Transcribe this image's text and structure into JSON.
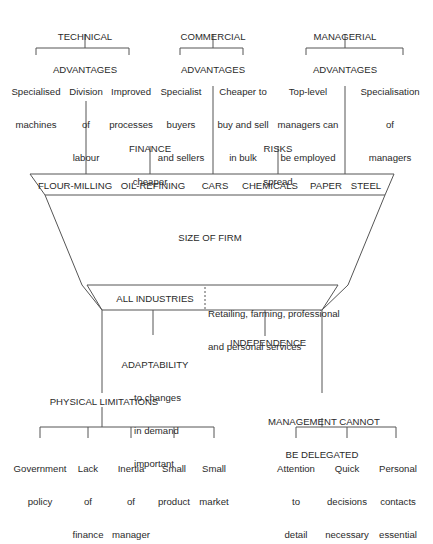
{
  "top_groups": [
    {
      "title": [
        "TECHNICAL",
        "ADVANTAGES"
      ],
      "items": [
        [
          "Specialised",
          "machines"
        ],
        [
          "Division",
          "of",
          "labour"
        ],
        [
          "Improved",
          "processes"
        ]
      ]
    },
    {
      "title": [
        "COMMERCIAL",
        "ADVANTAGES"
      ],
      "items": [
        [
          "Specialist",
          "buyers",
          "and sellers"
        ],
        [
          "Cheaper to",
          "buy and sell",
          "in bulk"
        ]
      ]
    },
    {
      "title": [
        "MANAGERIAL",
        "ADVANTAGES"
      ],
      "items": [
        [
          "Top-level",
          "managers can",
          "be employed"
        ],
        [
          "Specialisation",
          "of",
          "managers"
        ]
      ]
    }
  ],
  "mid_labels": {
    "finance": [
      "FINANCE",
      "cheaper"
    ],
    "risks": [
      "RISKS",
      "spread"
    ]
  },
  "industries_top": [
    "FLOUR-MILLING",
    "OIL-REFINING",
    "CARS",
    "CHEMICALS",
    "PAPER",
    "STEEL"
  ],
  "funnel_label": "SIZE OF FIRM",
  "industries_bottom": {
    "left": "ALL INDUSTRIES",
    "right": [
      "Retailing, farming, professional",
      "and personal services"
    ]
  },
  "lower_labels": {
    "adaptability": [
      "ADAPTABILITY",
      "to changes",
      "in demand",
      "important"
    ],
    "independence": "INDEPENDENCE"
  },
  "bottom_groups": [
    {
      "title": [
        "PHYSICAL LIMITATIONS"
      ],
      "items": [
        [
          "Government",
          "policy"
        ],
        [
          "Lack",
          "of",
          "finance"
        ],
        [
          "Inertia",
          "of",
          "manager"
        ],
        [
          "Small",
          "product"
        ],
        [
          "Small",
          "market"
        ]
      ]
    },
    {
      "title": [
        "MANAGEMENT CANNOT",
        "BE DELEGATED"
      ],
      "items": [
        [
          "Attention",
          "to",
          "detail"
        ],
        [
          "Quick",
          "decisions",
          "necessary"
        ],
        [
          "Personal",
          "contacts",
          "essential"
        ]
      ]
    }
  ]
}
